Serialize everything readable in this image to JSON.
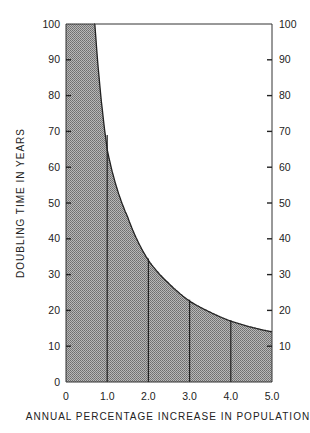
{
  "chart_data": {
    "type": "area",
    "title": "",
    "xlabel": "ANNUAL PERCENTAGE INCREASE IN POPULATION",
    "ylabel": "DOUBLING TIME IN YEARS",
    "xlim": [
      0,
      5.0
    ],
    "ylim": [
      0,
      100
    ],
    "x_ticks": [
      "0",
      "1.0",
      "2.0",
      "3.0",
      "4.0",
      "5.0"
    ],
    "y_ticks": [
      "0",
      "10",
      "20",
      "30",
      "40",
      "50",
      "60",
      "70",
      "80",
      "90",
      "100"
    ],
    "right_y_ticks": [
      "10",
      "20",
      "30",
      "40",
      "50",
      "60",
      "70",
      "80",
      "90",
      "100"
    ],
    "series": [
      {
        "name": "Doubling time",
        "x": [
          0.7,
          1.0,
          1.5,
          2.0,
          2.5,
          3.0,
          3.5,
          4.0,
          4.5,
          5.0
        ],
        "values": [
          100,
          65,
          46,
          34,
          27.5,
          22.6,
          19.5,
          17,
          15.3,
          14
        ]
      }
    ],
    "vertical_markers": [
      1.0,
      2.0,
      3.0,
      4.0
    ],
    "grid": false,
    "fill": "hatched gray under curve"
  }
}
